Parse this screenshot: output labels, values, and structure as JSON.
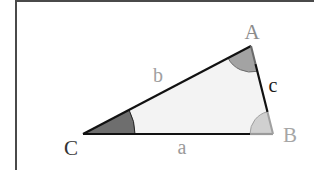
{
  "diagram": {
    "type": "triangle",
    "vertices": {
      "A": {
        "label": "A",
        "color": "#8c8c8c"
      },
      "B": {
        "label": "B",
        "color": "#a6a6a6"
      },
      "C": {
        "label": "C",
        "color": "#333333"
      }
    },
    "sides": {
      "a": {
        "label": "a",
        "color": "#9a9a9a",
        "between": "B-C"
      },
      "b": {
        "label": "b",
        "color": "#a0a0a0",
        "between": "A-C"
      },
      "c": {
        "label": "c",
        "color": "#1a1a1a",
        "between": "A-B"
      }
    },
    "angle_fills": {
      "C": "#6e6e6e",
      "A": "#a3a3a3",
      "B": "#d0d0d0"
    },
    "triangle_fill": "#f3f3f3",
    "edge_color": "#111111"
  }
}
